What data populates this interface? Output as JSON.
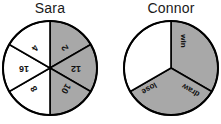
{
  "figure": {
    "type": "spinner-pair-diagram",
    "spinners": [
      {
        "name": "sara",
        "title": "Sara",
        "sector_count": 6,
        "sectors": [
          {
            "index": 0,
            "label": "2",
            "shaded": true,
            "start_deg": -90,
            "end_deg": -30
          },
          {
            "index": 1,
            "label": "12",
            "shaded": true,
            "start_deg": -30,
            "end_deg": 30
          },
          {
            "index": 2,
            "label": "10",
            "shaded": true,
            "start_deg": 30,
            "end_deg": 90
          },
          {
            "index": 3,
            "label": "8",
            "shaded": false,
            "start_deg": 90,
            "end_deg": 150
          },
          {
            "index": 4,
            "label": "16",
            "shaded": false,
            "start_deg": 150,
            "end_deg": 210
          },
          {
            "index": 5,
            "label": "4",
            "shaded": false,
            "start_deg": 210,
            "end_deg": 270
          }
        ]
      },
      {
        "name": "connor",
        "title": "Connor",
        "sector_count": 3,
        "sectors": [
          {
            "index": 0,
            "label": "win",
            "shaded": true,
            "start_deg": -90,
            "end_deg": 30
          },
          {
            "index": 1,
            "label": "draw",
            "shaded": true,
            "start_deg": 30,
            "end_deg": 150
          },
          {
            "index": 2,
            "label": "lose",
            "shaded": false,
            "start_deg": 150,
            "end_deg": 270
          }
        ]
      }
    ],
    "colors": {
      "shaded_fill": "#a8a8a8",
      "unshaded_fill": "#ffffff",
      "outline": "#000000",
      "label_text": "#111111",
      "title_text": "#1a1a1a",
      "background": "#ffffff"
    }
  }
}
